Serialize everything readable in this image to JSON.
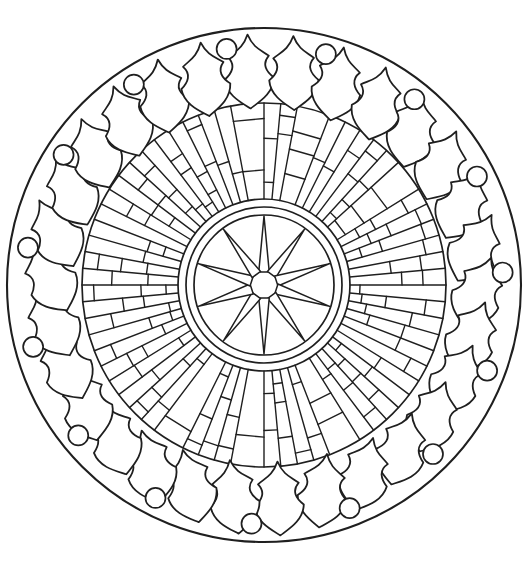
{
  "artwork": {
    "kind": "mandala-coloring-page-line-art",
    "canvas": {
      "width": 528,
      "height": 563,
      "background_color": "#ffffff",
      "line_color": "#1f1f1f"
    },
    "center": {
      "x": 264,
      "y": 285
    },
    "outer_rim": {
      "radius": 257,
      "stroke_width": 2.1
    },
    "leaf_ring": {
      "count": 30,
      "ring_radius": 214,
      "start_angle_deg": -4,
      "step_deg": 12,
      "tilt_amplitude_deg": 25,
      "jitter_deg": 9,
      "leaf_width_scale": 1.07,
      "stroke_width": 1.7,
      "fill_color": "#ffffff"
    },
    "dot_ring": {
      "count": 15,
      "radius": 239,
      "start_angle_deg": -33,
      "step_deg": 24,
      "dot_radius": 10,
      "stroke_width": 1.7,
      "fill_color": "#ffffff"
    },
    "mosaic_ring": {
      "outer_radius": 182,
      "inner_radius": 86,
      "slots": 68,
      "seed": 9,
      "merge_probability": 0.16,
      "cut_count_weights": [
        0.07,
        0.3,
        0.43,
        0.2
      ],
      "cut_min_fraction": 0.1,
      "cut_max_fraction": 0.9,
      "cut_min_separation": 0.17,
      "line_width": 1.4,
      "circle_width": 1.7
    },
    "star_medallion": {
      "outer_circle_radius": 78,
      "inner_circle_radius": 70,
      "points": 10,
      "spike_tip_radius": 69,
      "spike_base_radius": 14,
      "spike_base_half_angle_deg": 22,
      "stroke_width": 1.5,
      "fill_color": "#ffffff",
      "circle_width": 1.7
    }
  }
}
